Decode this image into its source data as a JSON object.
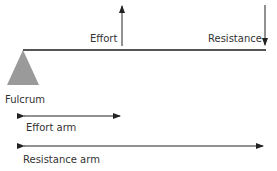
{
  "diagram": {
    "labels": {
      "effort": "Effort",
      "resistance": "Resistance",
      "fulcrum": "Fulcrum",
      "effort_arm": "Effort arm",
      "resistance_arm": "Resistance arm"
    },
    "colors": {
      "beam": "#555555",
      "fulcrum": "#9a9a9a",
      "arrow": "#222222",
      "text": "#333333"
    }
  }
}
